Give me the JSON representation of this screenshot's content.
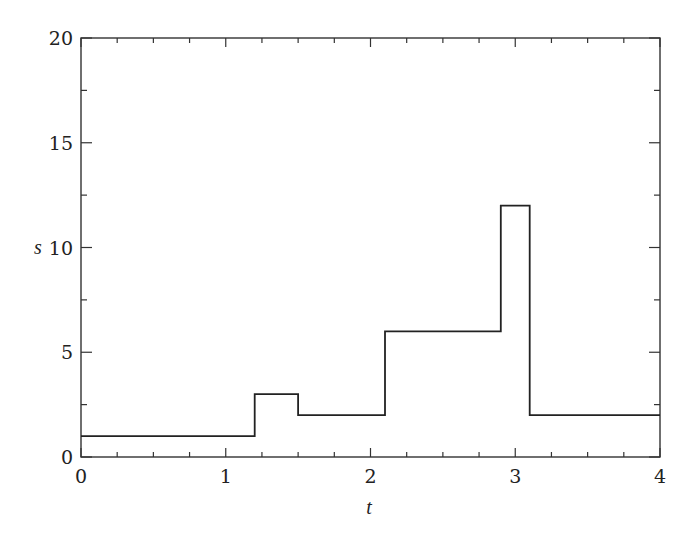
{
  "chart_data": {
    "type": "line",
    "subtype": "step",
    "title": "",
    "xlabel": "t",
    "ylabel": "s",
    "xlim": [
      0,
      4
    ],
    "ylim": [
      0,
      20
    ],
    "grid": false,
    "legend": null,
    "x_ticks": [
      0,
      1,
      2,
      3,
      4
    ],
    "x_tick_labels": [
      "0",
      "1",
      "2",
      "3",
      "4"
    ],
    "x_minor_step": 0.25,
    "y_ticks": [
      0,
      5,
      10,
      15,
      20
    ],
    "y_tick_labels": [
      "0",
      "5",
      "10",
      "15",
      "20"
    ],
    "y_minor_step": 2.5,
    "series": [
      {
        "name": "s(t)",
        "color": "#222222",
        "steps": [
          {
            "t_start": 0.0,
            "t_end": 1.2,
            "s": 1
          },
          {
            "t_start": 1.2,
            "t_end": 1.5,
            "s": 3
          },
          {
            "t_start": 1.5,
            "t_end": 2.1,
            "s": 2
          },
          {
            "t_start": 2.1,
            "t_end": 2.9,
            "s": 6
          },
          {
            "t_start": 2.9,
            "t_end": 3.1,
            "s": 12
          },
          {
            "t_start": 3.1,
            "t_end": 4.0,
            "s": 2
          }
        ],
        "x": [
          0,
          1.2,
          1.2,
          1.5,
          1.5,
          2.1,
          2.1,
          2.9,
          2.9,
          3.1,
          3.1,
          4.0
        ],
        "y": [
          1,
          1,
          3,
          3,
          2,
          2,
          6,
          6,
          12,
          12,
          2,
          2
        ]
      }
    ]
  }
}
